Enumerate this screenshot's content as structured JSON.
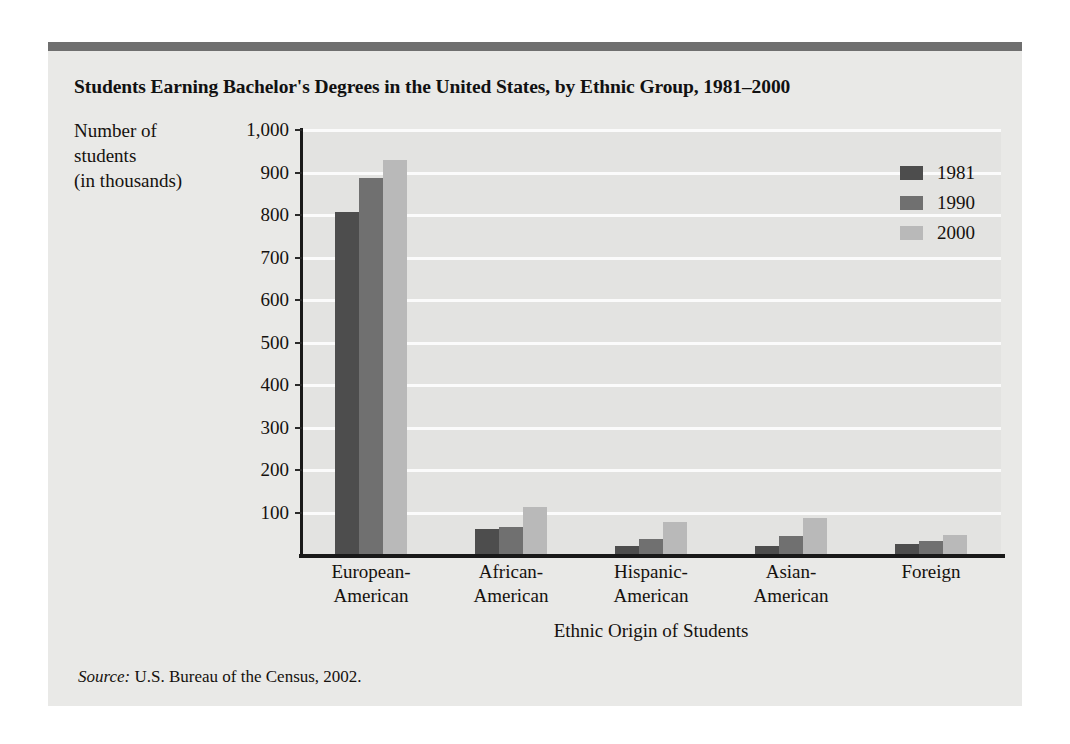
{
  "figure": {
    "title": "Students Earning Bachelor's Degrees in the United States, by Ethnic Group, 1981–2000",
    "source_prefix": "Source:",
    "source_text": " U.S. Bureau of the Census, 2002."
  },
  "colors": {
    "card_background": "#e9e9e7",
    "top_rule": "#6f6f6f",
    "plot_background": "#e3e3e1",
    "gridline": "#fbfbfb",
    "axis": "#191919",
    "series_1981": "#4d4d4d",
    "series_1990": "#707070",
    "series_2000": "#b9b9b9",
    "text": "#15110e"
  },
  "y_axis_caption": {
    "line1": "Number of",
    "line2": "students",
    "line3": "(in thousands)"
  },
  "chart_data": {
    "type": "bar",
    "title": "Students Earning Bachelor's Degrees in the United States, by Ethnic Group, 1981–2000",
    "subtitle": "",
    "xlabel": "Ethnic Origin of Students",
    "ylabel": "Number of students (in thousands)",
    "categories": [
      "European-American",
      "African-American",
      "Hispanic-American",
      "Asian-American",
      "Foreign"
    ],
    "category_lines": [
      [
        "European-",
        "American"
      ],
      [
        "African-",
        "American"
      ],
      [
        "Hispanic-",
        "American"
      ],
      [
        "Asian-",
        "American"
      ],
      [
        "Foreign"
      ]
    ],
    "series": [
      {
        "name": "1981",
        "color": "#4d4d4d",
        "values": [
          807,
          62,
          22,
          22,
          25
        ]
      },
      {
        "name": "1990",
        "color": "#707070",
        "values": [
          887,
          65,
          38,
          44,
          32
        ]
      },
      {
        "name": "2000",
        "color": "#b9b9b9",
        "values": [
          930,
          112,
          78,
          88,
          48
        ]
      }
    ],
    "ylim": [
      0,
      1000
    ],
    "ytick_values": [
      100,
      200,
      300,
      400,
      500,
      600,
      700,
      800,
      900,
      1000
    ],
    "ytick_labels": [
      "100",
      "200",
      "300",
      "400",
      "500",
      "600",
      "700",
      "800",
      "900",
      "1,000"
    ],
    "grid": true,
    "grid_axis": "y",
    "legend_position": "top-right",
    "legend_entries": [
      "1981",
      "1990",
      "2000"
    ],
    "units": "thousands of students",
    "source": "U.S. Bureau of the Census, 2002."
  }
}
